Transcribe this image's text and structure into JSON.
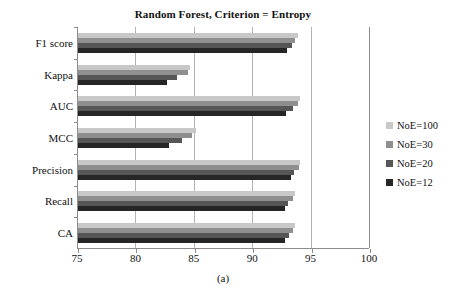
{
  "figure": {
    "caption": "(a)"
  },
  "chart_data": {
    "type": "bar",
    "orientation": "horizontal",
    "title": "Random Forest, Criterion = Entropy",
    "xlabel": "",
    "ylabel": "",
    "xlim": [
      75,
      100
    ],
    "xticks": [
      75,
      80,
      85,
      90,
      95,
      100
    ],
    "xtick_labels": [
      "75",
      "80",
      "85",
      "90",
      "95",
      "100"
    ],
    "grid": "vertical",
    "legend_position": "right",
    "categories": [
      "F1 score",
      "Kappa",
      "AUC",
      "MCC",
      "Precision",
      "Recall",
      "CA"
    ],
    "series": [
      {
        "name": "NoE=100",
        "color": "#c8c8c8",
        "values": [
          93.8,
          84.6,
          94.0,
          85.1,
          94.0,
          93.6,
          93.6
        ]
      },
      {
        "name": "NoE=30",
        "color": "#8f8f8f",
        "values": [
          93.6,
          84.4,
          93.8,
          84.8,
          93.9,
          93.4,
          93.4
        ]
      },
      {
        "name": "NoE=20",
        "color": "#565656",
        "values": [
          93.3,
          83.5,
          93.4,
          83.9,
          93.5,
          93.0,
          93.1
        ]
      },
      {
        "name": "NoE=12",
        "color": "#262626",
        "values": [
          92.9,
          82.6,
          92.8,
          82.8,
          93.2,
          92.7,
          92.7
        ]
      }
    ]
  },
  "legend": {
    "items": [
      {
        "label": "NoE=100",
        "color": "#c8c8c8"
      },
      {
        "label": "NoE=30",
        "color": "#8f8f8f"
      },
      {
        "label": "NoE=20",
        "color": "#565656"
      },
      {
        "label": "NoE=12",
        "color": "#262626"
      }
    ]
  }
}
